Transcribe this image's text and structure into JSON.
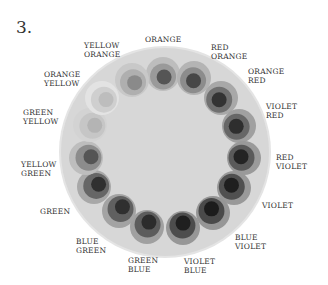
{
  "figure": {
    "number": "3."
  },
  "wheel": {
    "disc": {
      "cx": 165,
      "cy": 152,
      "r": 104,
      "fill": "#d7d7d7",
      "rim": "#e4e4e4"
    },
    "segments": [
      {
        "name": "ORANGE",
        "line1": "ORANGE",
        "line2": "",
        "cx": 163,
        "cy": 74,
        "outer": "#bdbdbd",
        "mid": "#9a9a9a",
        "inner": "#555555"
      },
      {
        "name": "RED ORANGE",
        "line1": "RED",
        "line2": "ORANGE",
        "cx": 194,
        "cy": 78,
        "outer": "#b4b4b4",
        "mid": "#8c8c8c",
        "inner": "#474747"
      },
      {
        "name": "ORANGE RED",
        "line1": "ORANGE",
        "line2": "RED",
        "cx": 221,
        "cy": 98,
        "outer": "#a8a8a8",
        "mid": "#707070",
        "inner": "#333333"
      },
      {
        "name": "VIOLET RED",
        "line1": "VIOLET",
        "line2": "RED",
        "cx": 239,
        "cy": 126,
        "outer": "#a0a0a0",
        "mid": "#676767",
        "inner": "#2e2e2e"
      },
      {
        "name": "RED VIOLET",
        "line1": "RED",
        "line2": "VIOLET",
        "cx": 244,
        "cy": 158,
        "outer": "#9a9a9a",
        "mid": "#5a5a5a",
        "inner": "#242424"
      },
      {
        "name": "VIOLET",
        "line1": "VIOLET",
        "line2": "",
        "cx": 234,
        "cy": 188,
        "outer": "#999999",
        "mid": "#505050",
        "inner": "#1f1f1f"
      },
      {
        "name": "BLUE VIOLET",
        "line1": "BLUE",
        "line2": "VIOLET",
        "cx": 213,
        "cy": 213,
        "outer": "#969696",
        "mid": "#4a4a4a",
        "inner": "#1c1c1c"
      },
      {
        "name": "VIOLET BLUE",
        "line1": "VIOLET",
        "line2": "BLUE",
        "cx": 183,
        "cy": 228,
        "outer": "#979797",
        "mid": "#4d4d4d",
        "inner": "#1f1f1f"
      },
      {
        "name": "GREEN BLUE",
        "line1": "GREEN",
        "line2": "BLUE",
        "cx": 147,
        "cy": 227,
        "outer": "#a0a0a0",
        "mid": "#5c5c5c",
        "inner": "#2c2c2c"
      },
      {
        "name": "BLUE GREEN",
        "line1": "BLUE",
        "line2": "GREEN",
        "cx": 119,
        "cy": 211,
        "outer": "#a3a3a3",
        "mid": "#606060",
        "inner": "#2f2f2f"
      },
      {
        "name": "GREEN",
        "line1": "GREEN",
        "line2": "",
        "cx": 94,
        "cy": 187,
        "outer": "#a8a8a8",
        "mid": "#666666",
        "inner": "#303030"
      },
      {
        "name": "YELLOW GREEN",
        "line1": "YELLOW",
        "line2": "GREEN",
        "cx": 86,
        "cy": 158,
        "outer": "#bdbdbd",
        "mid": "#8c8c8c",
        "inner": "#555555"
      },
      {
        "name": "GREEN YELLOW",
        "line1": "GREEN",
        "line2": "YELLOW",
        "cx": 90,
        "cy": 125,
        "outer": "#d3d3d3",
        "mid": "#c6c6c6",
        "inner": "#b4b4b4"
      },
      {
        "name": "ORANGE YELLOW",
        "line1": "ORANGE",
        "line2": "YELLOW",
        "cx": 102,
        "cy": 98,
        "outer": "#e3e3e3",
        "mid": "#cfcfcf",
        "inner": "#bdbdbd"
      },
      {
        "name": "YELLOW ORANGE",
        "line1": "YELLOW",
        "line2": "ORANGE",
        "cx": 132,
        "cy": 80,
        "outer": "#c8c8c8",
        "mid": "#afafaf",
        "inner": "#8a8a8a"
      }
    ]
  },
  "labels": [
    {
      "text": "ORANGE",
      "x": 145,
      "y": 35,
      "align": "center"
    },
    {
      "text": "RED\nORANGE",
      "x": 211,
      "y": 43,
      "align": "left"
    },
    {
      "text": "ORANGE\nRED",
      "x": 248,
      "y": 67,
      "align": "left"
    },
    {
      "text": "VIOLET\nRED",
      "x": 266,
      "y": 102,
      "align": "left"
    },
    {
      "text": "RED\nVIOLET",
      "x": 276,
      "y": 153,
      "align": "left"
    },
    {
      "text": "VIOLET",
      "x": 262,
      "y": 201,
      "align": "left"
    },
    {
      "text": "BLUE\nVIOLET",
      "x": 235,
      "y": 233,
      "align": "left"
    },
    {
      "text": "VIOLET\nBLUE",
      "x": 184,
      "y": 257,
      "align": "left"
    },
    {
      "text": "GREEN\nBLUE",
      "x": 128,
      "y": 256,
      "align": "left"
    },
    {
      "text": "BLUE\nGREEN",
      "x": 76,
      "y": 237,
      "align": "left"
    },
    {
      "text": "GREEN",
      "x": 40,
      "y": 207,
      "align": "left"
    },
    {
      "text": "YELLOW\nGREEN",
      "x": 21,
      "y": 160,
      "align": "left"
    },
    {
      "text": "GREEN\nYELLOW",
      "x": 23,
      "y": 108,
      "align": "left"
    },
    {
      "text": "ORANGE\nYELLOW",
      "x": 44,
      "y": 70,
      "align": "left"
    },
    {
      "text": "YELLOW\nORANGE",
      "x": 84,
      "y": 41,
      "align": "left"
    }
  ]
}
